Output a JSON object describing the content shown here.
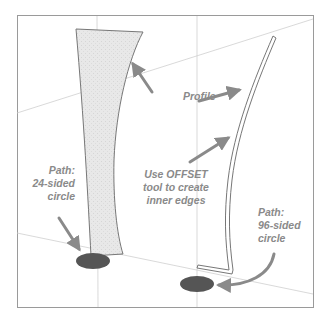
{
  "figure": {
    "colors": {
      "background": "#ffffff",
      "frame": "#9a9a9a",
      "axis_lines": "#c8c8c8",
      "profile_fill": "#e6e6e6",
      "profile_stroke": "#777777",
      "circle_fill": "#555555",
      "arrow": "#8a8a8a",
      "label_text": "#8a8a8a"
    }
  },
  "labels": {
    "profile": "Profile",
    "offset": {
      "line1": "Use OFFSET",
      "line2": "tool to create",
      "line3": "inner edges"
    },
    "path_left": {
      "line1": "Path:",
      "line2": "24-sided",
      "line3": "circle"
    },
    "path_right": {
      "line1": "Path:",
      "line2": "96-sided",
      "line3": "circle"
    }
  }
}
